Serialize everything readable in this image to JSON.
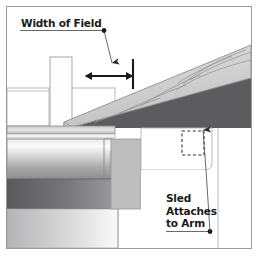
{
  "diagram": {
    "background_color": "#ffffff",
    "border_color": "#9a9a9a",
    "labels": {
      "width_of_field": "Width of Field",
      "sled_attaches_line1": "Sled",
      "sled_attaches_line2": "Attaches",
      "sled_attaches_line3": "to Arm"
    },
    "colors": {
      "line": "#58585a",
      "line_dark": "#1a1a1a",
      "board_face_light": "#d2d2d2",
      "board_face_mid": "#c2c2c2",
      "board_edge_dark": "#6e6e70",
      "wedge_dark": "#5c5c5e",
      "grain_line": "#8c8c8e",
      "panel_white": "#ffffff",
      "panel_gray": "#bdbdbd",
      "band_dark": "#646466",
      "band_mid": "#9a9a9c",
      "text": "#1a1a1a"
    },
    "elements": {
      "width_leader": "leader-line-from-label-to-dimension-arrow",
      "dimension_arrow": "double-headed-horizontal-arrow",
      "tick_mark": "vertical-reference-tick",
      "fence_block": "white-vertical-block",
      "angled_board": "inclined-board-with-wood-grain",
      "roller": "cylindrical-roller-with-gradient",
      "hidden_outline": "dashed-rectangle-hidden-detail",
      "sled_leader": "leader-line-with-up-arrow"
    }
  }
}
